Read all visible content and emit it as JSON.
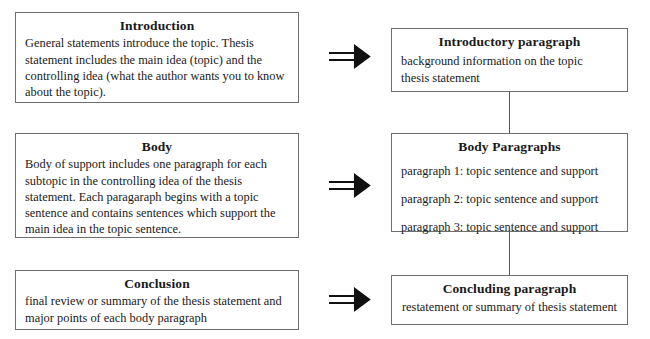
{
  "diagram": {
    "left_column": [
      {
        "title": "Introduction",
        "body": "General statements introduce the topic. Thesis statement includes the main idea (topic) and the controlling idea (what the author wants you to know about the topic)."
      },
      {
        "title": "Body",
        "body": "Body of support includes one paragraph for each subtopic in the controlling idea of the thesis statement. Each paragaraph begins with a topic sentence and contains sentences which support the main idea in the topic sentence."
      },
      {
        "title": "Conclusion",
        "body": "final review or summary of the thesis statement and major points of each body paragraph"
      }
    ],
    "right_column": [
      {
        "title": "Introductory paragraph",
        "line_1": "background information on the topic",
        "line_2": "thesis statement"
      },
      {
        "title": "Body Paragraphs",
        "items": [
          "paragraph 1: topic sentence and support",
          "paragraph 2: topic sentence and support",
          "paragraph 3: topic sentence and support"
        ]
      },
      {
        "title": "Concluding paragraph",
        "line_1": "restatement or summary of thesis statement"
      }
    ],
    "arrows": {
      "glyph_name": "double-right-arrow-icon",
      "count": 3
    },
    "colors": {
      "box_border": "#6e6e6e",
      "connector_line": "#555555",
      "text": "#1a1a1a",
      "background": "#ffffff"
    }
  }
}
